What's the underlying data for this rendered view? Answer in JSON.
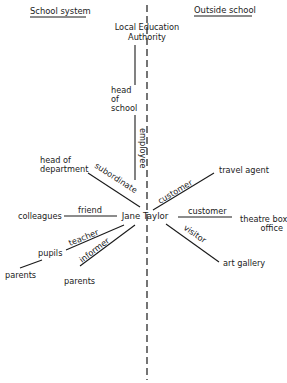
{
  "headings": {
    "left": "School system",
    "right": "Outside school"
  },
  "center": "Jane Taylor",
  "nodes": {
    "lea_line1": "Local Education",
    "lea_line2": "Authority",
    "head_of_school_1": "head",
    "head_of_school_2": "of",
    "head_of_school_3": "school",
    "head_of_department_1": "head of",
    "head_of_department_2": "department",
    "colleagues": "colleagues",
    "pupils": "pupils",
    "parents_of_pupils": "parents",
    "parents": "parents",
    "travel_agent": "travel agent",
    "theatre_box_1": "theatre box",
    "theatre_box_2": "office",
    "art_gallery": "art gallery"
  },
  "roles": {
    "employee": "employee",
    "subordinate": "subordinate",
    "friend": "friend",
    "teacher": "teacher",
    "informer": "informer",
    "customer_travel": "customer",
    "customer_theatre": "customer",
    "visitor": "visitor"
  }
}
